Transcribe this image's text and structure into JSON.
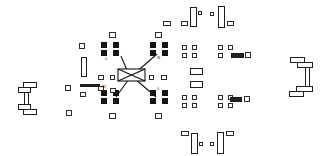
{
  "figure": {
    "kind": "line-drawing",
    "background_color": "#ffffff",
    "ink_color": "#141414",
    "outline_color": "#2b2b2b",
    "width": 329,
    "height": 156
  },
  "labels": [
    {
      "id": "lbl-a-top-left",
      "text": "A",
      "x": 104,
      "y": 56
    },
    {
      "id": "lbl-b-top-right",
      "text": "B",
      "x": 157,
      "y": 55
    },
    {
      "id": "lbl-h-bottom-left",
      "text": "H",
      "x": 102,
      "y": 84
    },
    {
      "id": "lbl-a-bottom-right",
      "text": "A",
      "x": 156,
      "y": 86
    }
  ],
  "center_element": {
    "id": "bowtie-hub",
    "description": "bowtie / butterfly hub at center where four diagonals converge",
    "x": 118,
    "y": 69,
    "w": 27,
    "h": 12
  },
  "diagonals": [
    {
      "id": "diag-nw",
      "x1": 121,
      "y1": 56,
      "x2": 129,
      "y2": 75
    },
    {
      "id": "diag-ne",
      "x1": 157,
      "y1": 54,
      "x2": 133,
      "y2": 75
    },
    {
      "id": "diag-sw",
      "x1": 116,
      "y1": 97,
      "x2": 129,
      "y2": 79
    },
    {
      "id": "diag-se",
      "x1": 156,
      "y1": 97,
      "x2": 134,
      "y2": 78
    }
  ],
  "left_bracket": {
    "id": "left-c-bracket",
    "description": "C shaped bracket assembly at far left",
    "segments": [
      {
        "x": 23,
        "y": 82,
        "w": 14,
        "h": 6
      },
      {
        "x": 18,
        "y": 87,
        "w": 13,
        "h": 6
      },
      {
        "x": 24,
        "y": 92,
        "w": 5,
        "h": 13
      },
      {
        "x": 18,
        "y": 104,
        "w": 13,
        "h": 6
      },
      {
        "x": 23,
        "y": 109,
        "w": 14,
        "h": 6
      }
    ]
  },
  "right_bracket": {
    "id": "right-i-bracket",
    "description": "I / C shaped bracket assembly at far right",
    "segments": [
      {
        "x": 290,
        "y": 57,
        "w": 15,
        "h": 6
      },
      {
        "x": 297,
        "y": 62,
        "w": 16,
        "h": 6
      },
      {
        "x": 305,
        "y": 67,
        "w": 5,
        "h": 20
      },
      {
        "x": 296,
        "y": 86,
        "w": 17,
        "h": 6
      },
      {
        "x": 289,
        "y": 91,
        "w": 15,
        "h": 6
      }
    ]
  },
  "filled_nodes": [
    {
      "x": 101,
      "y": 42,
      "w": 6,
      "h": 6
    },
    {
      "x": 113,
      "y": 42,
      "w": 6,
      "h": 6
    },
    {
      "x": 101,
      "y": 50,
      "w": 6,
      "h": 6
    },
    {
      "x": 113,
      "y": 50,
      "w": 6,
      "h": 6
    },
    {
      "x": 150,
      "y": 42,
      "w": 6,
      "h": 6
    },
    {
      "x": 162,
      "y": 42,
      "w": 6,
      "h": 6
    },
    {
      "x": 150,
      "y": 50,
      "w": 6,
      "h": 6
    },
    {
      "x": 162,
      "y": 50,
      "w": 6,
      "h": 6
    },
    {
      "x": 101,
      "y": 90,
      "w": 6,
      "h": 6
    },
    {
      "x": 113,
      "y": 90,
      "w": 6,
      "h": 6
    },
    {
      "x": 101,
      "y": 98,
      "w": 6,
      "h": 6
    },
    {
      "x": 113,
      "y": 98,
      "w": 6,
      "h": 6
    },
    {
      "x": 150,
      "y": 90,
      "w": 6,
      "h": 6
    },
    {
      "x": 162,
      "y": 90,
      "w": 6,
      "h": 6
    },
    {
      "x": 150,
      "y": 98,
      "w": 6,
      "h": 6
    },
    {
      "x": 162,
      "y": 98,
      "w": 6,
      "h": 6
    }
  ],
  "outline_nodes": [
    {
      "x": 109,
      "y": 32,
      "w": 7,
      "h": 6
    },
    {
      "x": 155,
      "y": 32,
      "w": 7,
      "h": 6
    },
    {
      "x": 109,
      "y": 113,
      "w": 7,
      "h": 6
    },
    {
      "x": 155,
      "y": 113,
      "w": 7,
      "h": 6
    },
    {
      "x": 79,
      "y": 43,
      "w": 6,
      "h": 6
    },
    {
      "x": 65,
      "y": 85,
      "w": 6,
      "h": 6
    },
    {
      "x": 66,
      "y": 110,
      "w": 6,
      "h": 6
    },
    {
      "x": 80,
      "y": 92,
      "w": 6,
      "h": 5
    },
    {
      "x": 98,
      "y": 75,
      "w": 6,
      "h": 5
    },
    {
      "x": 110,
      "y": 75,
      "w": 5,
      "h": 5
    },
    {
      "x": 98,
      "y": 86,
      "w": 6,
      "h": 5
    },
    {
      "x": 110,
      "y": 88,
      "w": 6,
      "h": 5
    },
    {
      "x": 149,
      "y": 75,
      "w": 5,
      "h": 5
    },
    {
      "x": 161,
      "y": 75,
      "w": 6,
      "h": 5
    },
    {
      "x": 182,
      "y": 45,
      "w": 5,
      "h": 5
    },
    {
      "x": 192,
      "y": 45,
      "w": 5,
      "h": 5
    },
    {
      "x": 182,
      "y": 53,
      "w": 5,
      "h": 5
    },
    {
      "x": 192,
      "y": 53,
      "w": 5,
      "h": 5
    },
    {
      "x": 182,
      "y": 95,
      "w": 5,
      "h": 5
    },
    {
      "x": 192,
      "y": 95,
      "w": 5,
      "h": 5
    },
    {
      "x": 182,
      "y": 103,
      "w": 5,
      "h": 5
    },
    {
      "x": 192,
      "y": 103,
      "w": 5,
      "h": 5
    },
    {
      "x": 218,
      "y": 45,
      "w": 5,
      "h": 5
    },
    {
      "x": 228,
      "y": 45,
      "w": 5,
      "h": 5
    },
    {
      "x": 218,
      "y": 53,
      "w": 5,
      "h": 5
    },
    {
      "x": 245,
      "y": 52,
      "w": 6,
      "h": 6
    },
    {
      "x": 218,
      "y": 95,
      "w": 5,
      "h": 5
    },
    {
      "x": 228,
      "y": 95,
      "w": 5,
      "h": 5
    },
    {
      "x": 218,
      "y": 103,
      "w": 5,
      "h": 5
    },
    {
      "x": 228,
      "y": 103,
      "w": 5,
      "h": 5
    },
    {
      "x": 244,
      "y": 96,
      "w": 6,
      "h": 6
    },
    {
      "x": 163,
      "y": 21,
      "w": 8,
      "h": 5
    },
    {
      "x": 181,
      "y": 21,
      "w": 7,
      "h": 5
    },
    {
      "x": 227,
      "y": 21,
      "w": 7,
      "h": 5
    },
    {
      "x": 181,
      "y": 131,
      "w": 8,
      "h": 5
    },
    {
      "x": 226,
      "y": 131,
      "w": 8,
      "h": 5
    },
    {
      "x": 198,
      "y": 11,
      "w": 4,
      "h": 4
    },
    {
      "x": 210,
      "y": 12,
      "w": 4,
      "h": 4
    },
    {
      "x": 199,
      "y": 142,
      "w": 4,
      "h": 4
    },
    {
      "x": 210,
      "y": 142,
      "w": 4,
      "h": 4
    }
  ],
  "tall_bars": [
    {
      "x": 81,
      "y": 57,
      "w": 6,
      "h": 20
    },
    {
      "x": 190,
      "y": 68,
      "w": 13,
      "h": 7
    },
    {
      "x": 190,
      "y": 81,
      "w": 13,
      "h": 7
    },
    {
      "x": 190,
      "y": 7,
      "w": 7,
      "h": 20
    },
    {
      "x": 218,
      "y": 6,
      "w": 7,
      "h": 22
    },
    {
      "x": 191,
      "y": 133,
      "w": 7,
      "h": 21
    },
    {
      "x": 217,
      "y": 132,
      "w": 7,
      "h": 22
    }
  ],
  "horizontal_bars": [
    {
      "x": 80,
      "y": 84,
      "w": 20,
      "h": 3
    },
    {
      "x": 231,
      "y": 53,
      "w": 13,
      "h": 5
    },
    {
      "x": 230,
      "y": 97,
      "w": 12,
      "h": 5
    }
  ]
}
